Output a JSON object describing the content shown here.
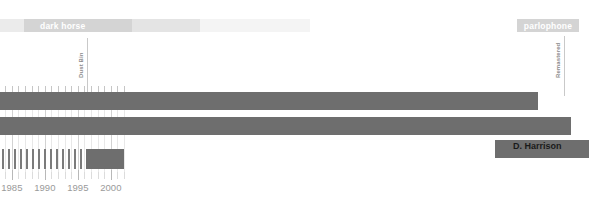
{
  "chart_data": {
    "type": "bar",
    "title": "",
    "xlabel": "",
    "ylabel": "",
    "orientation": "horizontal",
    "axis": {
      "min_year": 1983.2,
      "max_year": 2002.3,
      "px_per_year": 6.6,
      "tick_interval_years": 1,
      "label_interval_years": 5,
      "labels": [
        "1985",
        "1990",
        "1995",
        "2000"
      ],
      "label_years": [
        1985,
        1990,
        1995,
        2000
      ],
      "grid": true,
      "legend": "none"
    },
    "category_bands": [
      {
        "label": "dark horse",
        "start_year": 1983.2,
        "end_year": 1990.2,
        "color": "#d4d4d4",
        "text_color": "#ffffff"
      },
      {
        "label": "parlophone",
        "start_year": 2001.6,
        "end_year": 2002.3,
        "color": "#d4d4d4",
        "text_color": "#ffffff"
      }
    ],
    "annotations": [
      {
        "label": "Dust Bin",
        "year": 1986.3,
        "orientation": "vertical"
      },
      {
        "label": "Remastered",
        "year": 2002.5,
        "orientation": "vertical"
      }
    ],
    "series": [
      {
        "name": "bar-row-1",
        "start_year": 1983.2,
        "end_year": 2000.6,
        "color": "#6e6e6e"
      },
      {
        "name": "bar-row-2",
        "start_year": 1983.2,
        "end_year": 2005.6,
        "color": "#6e6e6e"
      },
      {
        "name": "D. Harrison",
        "start_year": 2000.2,
        "end_year": 2002.3,
        "color": "#6e6e6e",
        "label": "D. Harrison",
        "label_color": "#1a1a1a"
      }
    ],
    "event_strip": {
      "color": "#7b7b7b",
      "tick_positions_px": [
        2,
        8,
        14,
        20,
        26,
        32,
        38,
        44,
        50,
        56,
        62,
        68,
        74,
        80
      ],
      "block": {
        "start_px": 86,
        "end_px": 124,
        "color": "#6e6e6e"
      }
    }
  },
  "labels": {
    "band_left": "dark horse",
    "band_right": "parlophone",
    "annotation_left": "Dust Bin",
    "annotation_right": "Remastered",
    "bar_label": "D. Harrison",
    "year_1": "1985",
    "year_2": "1990",
    "year_3": "1995",
    "year_4": "2000"
  },
  "colors": {
    "bar": "#6e6e6e",
    "band": "#d4d4d4",
    "grid": "#e8e8e8",
    "axis_text": "#9a9a9a",
    "band_text": "#ffffff",
    "label_text": "#1a1a1a"
  }
}
